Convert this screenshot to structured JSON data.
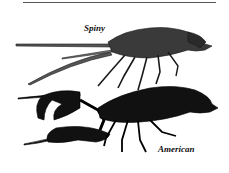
{
  "illustration": {
    "labels": {
      "spiny": "Spiny",
      "american": "American"
    },
    "colors": {
      "ink": "#1a1a1a",
      "spiny_body": "#3a3a3a",
      "american_body": "#111111",
      "rule": "#555555"
    }
  }
}
